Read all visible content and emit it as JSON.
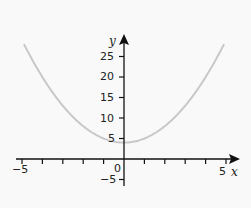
{
  "chart_data": {
    "type": "line",
    "title": "",
    "xlabel": "x",
    "ylabel": "y",
    "xlim": [
      -5,
      5
    ],
    "ylim": [
      -5,
      28
    ],
    "grid": false,
    "x_ticks": [
      -5,
      -4,
      -3,
      -2,
      -1,
      0,
      1,
      2,
      3,
      4,
      5
    ],
    "x_tick_labels": [
      "-5",
      "0",
      "5"
    ],
    "y_ticks": [
      -5,
      5,
      10,
      15,
      20,
      25
    ],
    "y_tick_labels": [
      "-5",
      "5",
      "10",
      "15",
      "20",
      "25"
    ],
    "series": [
      {
        "name": "y = x^2 + 4",
        "color": "#c8c8c8",
        "x": [
          -4.9,
          -4,
          -3,
          -2,
          -1,
          0,
          1,
          2,
          3,
          4,
          4.9
        ],
        "values": [
          28.0,
          20,
          13,
          8,
          5,
          4,
          5,
          8,
          13,
          20,
          28.0
        ]
      }
    ]
  },
  "labels": {
    "x_axis": "x",
    "y_axis": "y",
    "origin": "0",
    "x_min": "−5",
    "x_max": "5",
    "y_neg5": "−5",
    "y5": "5",
    "y10": "10",
    "y15": "15",
    "y20": "20",
    "y25": "25"
  }
}
